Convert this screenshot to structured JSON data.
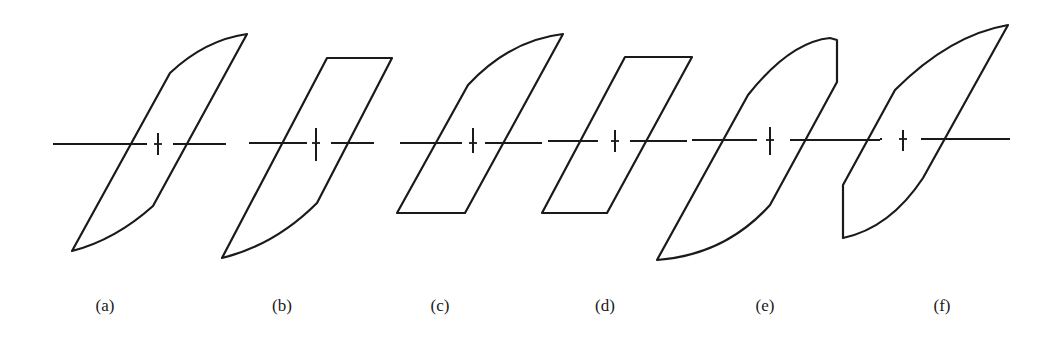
{
  "figure": {
    "panels": [
      {
        "label": "(a)",
        "label_x": 105,
        "shape": "curved top and bottom (saturating) loop",
        "path": "M72,251 L170,73 Q205,40 247,34 L153,206 Q115,240 72,251 Z",
        "axis": {
          "y": 144,
          "left": [
            53,
            147
          ],
          "right": [
            173,
            226
          ]
        },
        "tick": {
          "x": 158,
          "y1": 133,
          "y2": 155
        }
      },
      {
        "label": "(b)",
        "label_x": 282,
        "shape": "flat top, curved bottom loop",
        "path": "M222,258 L327,58 L392,58 L317,203 Q275,245 222,258 Z",
        "axis": {
          "y": 143,
          "left": [
            249,
            307
          ],
          "right": [
            331,
            374
          ]
        },
        "tick": {
          "x": 316,
          "y1": 128,
          "y2": 161
        }
      },
      {
        "label": "(c)",
        "label_x": 440,
        "shape": "curved top, flat bottom loop",
        "path": "M397,213 L468,85 Q510,40 563,34 L465,213 Z",
        "axis": {
          "y": 143,
          "left": [
            400,
            462
          ],
          "right": [
            485,
            542
          ]
        },
        "tick": {
          "x": 473,
          "y1": 128,
          "y2": 153
        }
      },
      {
        "label": "(d)",
        "label_x": 605,
        "shape": "parallelogram loop (flat top and bottom)",
        "path": "M542,213 L625,57 L692,57 L607,213 Z",
        "axis": {
          "y": 141,
          "left": [
            548,
            598
          ],
          "right": [
            630,
            687
          ]
        },
        "tick": {
          "x": 615,
          "y1": 130,
          "y2": 152
        }
      },
      {
        "label": "(e)",
        "label_x": 765,
        "shape": "curved loop with vertical right edge at top",
        "path": "M657,260 L748,95 Q790,42 830,38 L837,40 L837,82 L770,205 Q725,255 657,260 Z",
        "axis": {
          "y": 140,
          "left": [
            692,
            757
          ],
          "right": [
            790,
            880
          ]
        },
        "tick": {
          "x": 770,
          "y1": 127,
          "y2": 155
        }
      },
      {
        "label": "(f)",
        "label_x": 942,
        "shape": "curved loop with vertical left edge at bottom",
        "path": "M843,238 L843,185 L895,90 Q950,35 1008,25 L923,178 Q890,228 843,238 Z",
        "axis": {
          "y": 139,
          "left": [
            882,
            880
          ],
          "right": [
            921,
            1010
          ]
        },
        "tick": {
          "x": 903,
          "y1": 130,
          "y2": 151
        }
      }
    ],
    "colors": {
      "stroke": "#1a1a1a",
      "background": "#ffffff"
    }
  }
}
